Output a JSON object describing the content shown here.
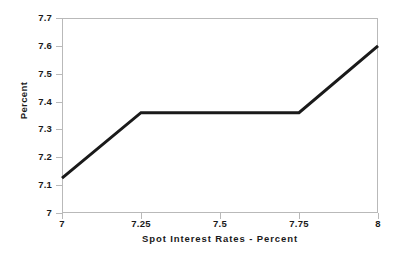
{
  "chart_data": {
    "type": "line",
    "title": "",
    "subtitle": "",
    "xlabel": "Spot Interest Rates - Percent",
    "ylabel": "Percent",
    "xlim": [
      7,
      8
    ],
    "ylim": [
      7,
      7.7
    ],
    "grid": false,
    "legend": null,
    "x_ticks": [
      "7",
      "7.25",
      "7.5",
      "7.75",
      "8"
    ],
    "x_tick_values": [
      7,
      7.25,
      7.5,
      7.75,
      8
    ],
    "y_ticks": [
      "7",
      "7.1",
      "7.2",
      "7.3",
      "7.4",
      "7.5",
      "7.6",
      "7.7"
    ],
    "y_tick_values": [
      7,
      7.1,
      7.2,
      7.3,
      7.4,
      7.5,
      7.6,
      7.7
    ],
    "series": [
      {
        "name": "value",
        "color": "#1a1a1a",
        "line_width": 3,
        "x": [
          7,
          7.25,
          7.75,
          8
        ],
        "values": [
          7.125,
          7.36,
          7.36,
          7.6
        ]
      }
    ],
    "annotations": []
  },
  "axes": {
    "frame_color": "#b9b9b9",
    "tick_color": "#b9b9b9",
    "text_color": "#1a1a1a"
  }
}
